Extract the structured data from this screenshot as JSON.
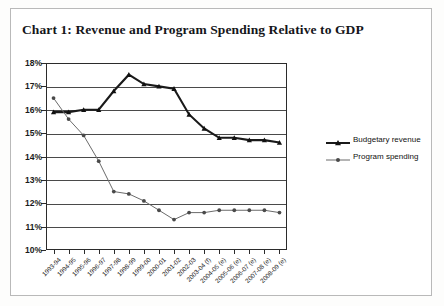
{
  "figure": {
    "title": "Chart 1: Revenue and Program Spending Relative to GDP",
    "frame_color": "#b9b9b9"
  },
  "legend": {
    "position": "right",
    "items": [
      {
        "label": "Budgetary revenue",
        "marker": "triangle",
        "color": "#1a1a1a",
        "icon": "legend-line-triangle-icon"
      },
      {
        "label": "Program spending",
        "marker": "circle",
        "color": "#6b6b6b",
        "icon": "legend-line-circle-icon"
      }
    ]
  },
  "chart_data": {
    "type": "line",
    "title": "Chart 1: Revenue and Program Spending Relative to GDP",
    "xlabel": "",
    "ylabel": "",
    "ylim": [
      10,
      18
    ],
    "ytick_step": 1,
    "ytick_labels": [
      "18%",
      "17%",
      "16%",
      "15%",
      "14%",
      "13%",
      "12%",
      "11%",
      "10%"
    ],
    "ytick_values": [
      18,
      17,
      16,
      15,
      14,
      13,
      12,
      11,
      10
    ],
    "grid": true,
    "legend_position": "right",
    "categories": [
      "1993-94",
      "1994-95",
      "1995-96",
      "1996-97",
      "1997-98",
      "1998-99",
      "1999-00",
      "2000-01",
      "2001-02",
      "2002-03",
      "2003-04 (f)",
      "2004-05 (e)",
      "2005-06 (e)",
      "2006-07 (e)",
      "2007-08 (e)",
      "2008-09 (e)"
    ],
    "series": [
      {
        "name": "Budgetary revenue",
        "marker": "triangle",
        "color": "#1a1a1a",
        "values": [
          15.9,
          15.9,
          16.0,
          16.0,
          16.8,
          17.5,
          17.1,
          17.0,
          16.9,
          15.8,
          15.2,
          14.8,
          14.8,
          14.7,
          14.7,
          14.6
        ]
      },
      {
        "name": "Program spending",
        "marker": "circle",
        "color": "#6b6b6b",
        "values": [
          16.5,
          15.6,
          14.9,
          13.8,
          12.5,
          12.4,
          12.1,
          11.7,
          11.3,
          11.6,
          11.6,
          11.7,
          11.7,
          11.7,
          11.7,
          11.6
        ]
      }
    ]
  }
}
